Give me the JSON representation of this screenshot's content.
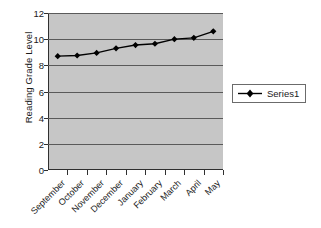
{
  "chart_data": {
    "type": "line",
    "title": "",
    "xlabel": "",
    "ylabel": "Reading Grade Level",
    "ylim": [
      0,
      12
    ],
    "ytick_step": 2,
    "yticks": [
      "0",
      "2",
      "4",
      "6",
      "8",
      "10",
      "12"
    ],
    "grid": true,
    "legend_position": "right",
    "categories": [
      "September",
      "October",
      "November",
      "December",
      "January",
      "February",
      "March",
      "April",
      "May"
    ],
    "series": [
      {
        "name": "Series1",
        "marker": "diamond",
        "values": [
          8.7,
          8.75,
          8.95,
          9.3,
          9.55,
          9.65,
          10.0,
          10.1,
          10.6
        ]
      }
    ],
    "colors": {
      "plot_background": "#c6c6c6",
      "gridline": "#5a5a5a",
      "axis": "#303030",
      "series_line": "#000000",
      "series_marker": "#000000",
      "legend_border": "#6b6b6b",
      "legend_background": "#ffffff",
      "page_background": "#ffffff",
      "text": "#1a1a1a"
    }
  }
}
